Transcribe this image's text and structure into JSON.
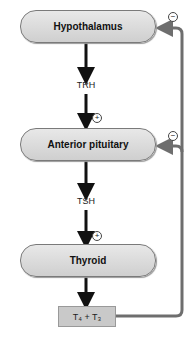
{
  "diagram": {
    "nodes": {
      "hypothalamus": "Hypothalamus",
      "anterior_pituitary": "Anterior pituitary",
      "thyroid": "Thyroid",
      "hormones_box": "T₄ + T₃"
    },
    "edge_labels": {
      "trh": "TRH",
      "tsh": "TSH"
    },
    "signs": {
      "stim_1": "+",
      "stim_2": "+",
      "inhib_1": "−",
      "inhib_2": "−"
    },
    "colors": {
      "pill_fill": "#d9d9d9",
      "arrow": "#111111",
      "feedback": "#6e6e6e",
      "box_fill": "#c9c9c9"
    }
  }
}
